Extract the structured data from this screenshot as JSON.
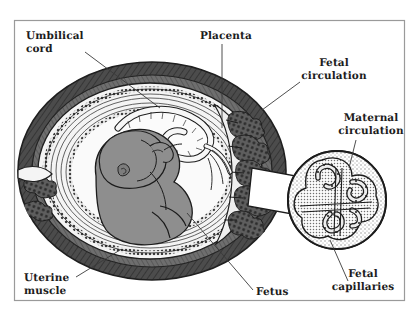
{
  "figure": {
    "type": "anatomical-illustration",
    "style": "grayscale line drawing with halftone shading",
    "frame": {
      "visible": true,
      "color": "#9a9a9a"
    },
    "background": "#ffffff"
  },
  "labels": [
    {
      "id": "umbilical-cord",
      "text": "Umbilical\ncord",
      "align": "left",
      "x": 26,
      "y": 30,
      "leader": {
        "from": [
          85,
          52
        ],
        "to": [
          160,
          108
        ]
      }
    },
    {
      "id": "placenta",
      "text": "Placenta",
      "align": "left",
      "x": 200,
      "y": 30,
      "leader": {
        "from": [
          222,
          44
        ],
        "to": [
          222,
          128
        ]
      }
    },
    {
      "id": "fetal-circulation",
      "text": "Fetal\ncirculation",
      "align": "center",
      "x": 296,
      "y": 57,
      "leader": {
        "from": [
          300,
          82
        ],
        "to": [
          262,
          110
        ]
      }
    },
    {
      "id": "maternal-circulation",
      "text": "Maternal\ncirculation",
      "align": "center",
      "x": 333,
      "y": 112,
      "leader": {
        "from": [
          356,
          140
        ],
        "to": [
          349,
          168
        ]
      }
    },
    {
      "id": "uterine-muscle",
      "text": "Uterine\nmuscle",
      "align": "left",
      "x": 24,
      "y": 272,
      "leader": {
        "from": [
          76,
          277
        ],
        "to": [
          120,
          250
        ]
      }
    },
    {
      "id": "fetus",
      "text": "Fetus",
      "align": "left",
      "x": 256,
      "y": 286,
      "leader": {
        "from": [
          253,
          290
        ],
        "to": [
          187,
          213
        ]
      }
    },
    {
      "id": "fetal-capillaries",
      "text": "Fetal\ncapillaries",
      "align": "center",
      "x": 340,
      "y": 282,
      "leader": {
        "from": [
          348,
          281
        ],
        "to": [
          330,
          240
        ]
      }
    }
  ],
  "colors": {
    "ink": "#1c1c1c",
    "leader_line": "#3a3a3a",
    "uterine_muscle_dark": "#4c4c4c",
    "uterine_muscle_mid": "#6e6e6e",
    "fetus_fill": "#8e8e8e",
    "amnion_fill": "#f2f2f2",
    "villi_fill": "#595959",
    "inset_stipple": "#c9c9c9",
    "frame": "#9a9a9a"
  },
  "structures": {
    "uterus_wall": "Thick dark hatched myometrium forming the outer ovoid",
    "decidua_layers": "Concentric pale bands with beaded membrane texture",
    "amniotic_cavity": "Pale space surrounding the fetus",
    "umbilical_cord": "Coiled cord running from fetal abdomen to placental disc",
    "placenta": "Right-side disc with branching chorionic villi",
    "fetus": "Gray silhouette curled head-down in fetal position",
    "inset": "Circular magnified view of a placental villus showing fetal capillaries in maternal blood space"
  }
}
